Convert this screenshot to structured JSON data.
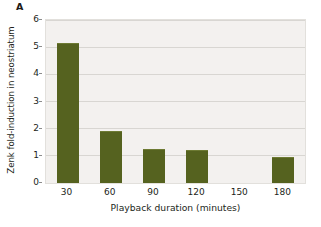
{
  "figure": {
    "panel_label": "A",
    "background_color": "#ffffff",
    "plot_background_color": "#f3f1ef",
    "bar_color": "#55621f",
    "gridline_color": "#d8d6d2",
    "text_color": "#231f20"
  },
  "chart_data": {
    "type": "bar",
    "title": "",
    "xlabel": "Playback duration (minutes)",
    "ylabel": "Zenk fold-induction in neostriatum",
    "categories": [
      "30",
      "60",
      "90",
      "120",
      "150",
      "180"
    ],
    "values": [
      5.15,
      1.9,
      1.25,
      1.22,
      null,
      0.97
    ],
    "series": [
      {
        "name": "Zenk fold-induction in neostriatum",
        "values": [
          5.15,
          1.9,
          1.25,
          1.22,
          null,
          0.97
        ]
      }
    ],
    "ylim": [
      0,
      6
    ],
    "yticks": [
      0,
      1,
      2,
      3,
      4,
      5,
      6
    ],
    "ytick_labels": [
      "0",
      "1",
      "2",
      "3",
      "4",
      "5",
      "6"
    ],
    "xtick_labels": [
      "30",
      "60",
      "90",
      "120",
      "150",
      "180"
    ],
    "grid": true,
    "grid_axis": "y",
    "legend": false,
    "legend_position": "none"
  }
}
